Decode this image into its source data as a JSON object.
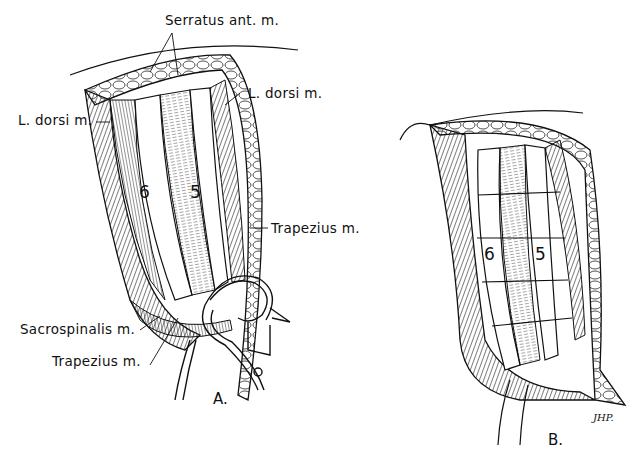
{
  "figure": {
    "panels": [
      {
        "id": "A",
        "caption": "A.",
        "labels": {
          "serratus": "Serratus ant. m.",
          "l_dorsi_right": "L. dorsi m.",
          "l_dorsi_left": "L. dorsi m.",
          "trapezius_right": "Trapezius m.",
          "sacrospinalis": "Sacrospinalis m.",
          "trapezius_bottom": "Trapezius m."
        },
        "rib_numbers": [
          "6",
          "5"
        ]
      },
      {
        "id": "B",
        "caption": "B.",
        "rib_numbers": [
          "6",
          "5"
        ],
        "signature": "JHP."
      }
    ],
    "colors": {
      "ink": "#111111",
      "background": "#ffffff"
    }
  }
}
